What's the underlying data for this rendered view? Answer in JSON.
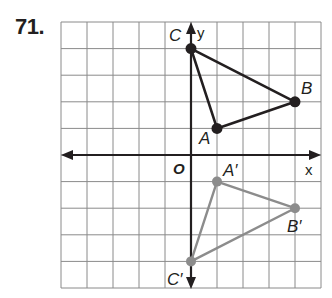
{
  "problem": {
    "number": "71."
  },
  "graph": {
    "grid": {
      "cols": 10,
      "rows": 10,
      "xmin": -5,
      "xmax": 5,
      "ymin": -5,
      "ymax": 5,
      "line_color": "#8a8a8a"
    },
    "axes": {
      "x_label": "x",
      "y_label": "y",
      "origin_label": "O",
      "color": "#231f20"
    },
    "original_triangle": {
      "color": "#231f20",
      "points": [
        {
          "name": "A",
          "label": "A",
          "x": 1,
          "y": 1
        },
        {
          "name": "B",
          "label": "B",
          "x": 4,
          "y": 2
        },
        {
          "name": "C",
          "label": "C",
          "x": 0,
          "y": 4
        }
      ]
    },
    "image_triangle": {
      "color": "#8c8c8c",
      "points": [
        {
          "name": "A-prime",
          "label": "A′",
          "x": 1,
          "y": -1
        },
        {
          "name": "B-prime",
          "label": "B′",
          "x": 4,
          "y": -2
        },
        {
          "name": "C-prime",
          "label": "C′",
          "x": 0,
          "y": -4
        }
      ]
    }
  }
}
